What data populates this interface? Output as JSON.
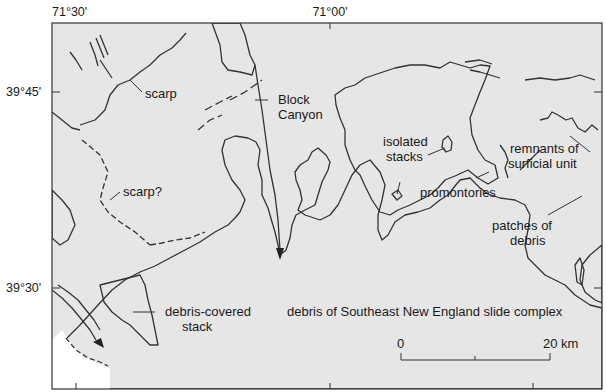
{
  "map": {
    "coordinates": {
      "top_left_lon": "71°30'",
      "top_right_lon": "71°00'",
      "upper_lat": "39°45'",
      "lower_lat": "39°30'"
    },
    "labels": {
      "scarp": "scarp",
      "scarp_q": "scarp?",
      "block_canyon_1": "Block",
      "block_canyon_2": "Canyon",
      "isolated_1": "isolated",
      "isolated_2": "stacks",
      "promontories": "promontories",
      "remnants_1": "remnants of",
      "remnants_2": "surficial unit",
      "patches_1": "patches of",
      "patches_2": "debris",
      "debris_stack_1": "debris-covered",
      "debris_stack_2": "stack",
      "slide_complex": "debris of Southeast New England slide complex"
    },
    "scale_bar": {
      "start_label": "0",
      "end_label": "20 km"
    },
    "colors": {
      "surficial_unit_fill": "#e6e6e6",
      "debris_fill": "#ffffff",
      "line": "#333333"
    }
  }
}
